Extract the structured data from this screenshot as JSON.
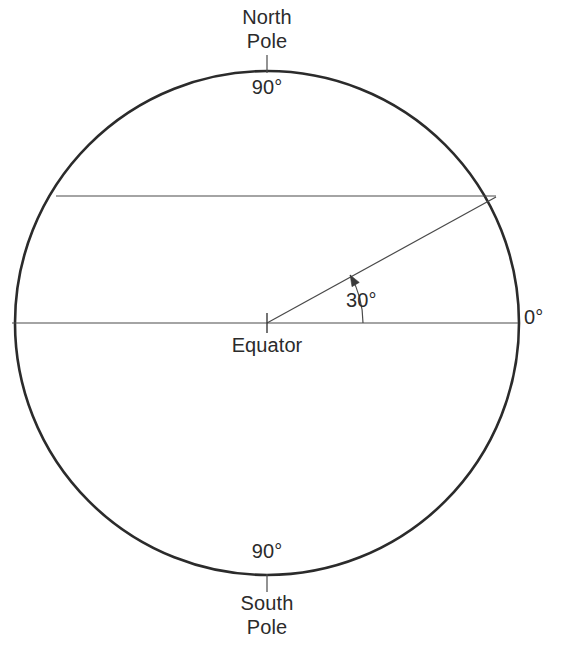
{
  "figure": {
    "background_color": "#ffffff",
    "stroke_color": "#2b2b2b",
    "text_color": "#2b2b2b"
  },
  "labels": {
    "north_pole": "North\nPole",
    "north_pole_line1": "North",
    "north_pole_line2": "Pole",
    "north_degree": "90°",
    "south_degree": "90°",
    "south_pole": "South\nPole",
    "south_pole_line1": "South",
    "south_pole_line2": "Pole",
    "equator": "Equator",
    "zero_degree": "0°",
    "angle_degree": "30°"
  },
  "chart_data": {
    "type": "diagram",
    "geometry": {
      "circle": {
        "cx": 267,
        "cy": 323,
        "r": 252,
        "stroke_width": 2.6
      },
      "equator_line": {
        "x1": 12,
        "y1": 323,
        "x2": 518,
        "y2": 323,
        "stroke_width": 1.2
      },
      "latitude_chord": {
        "x1": 56,
        "y1": 196,
        "x2": 496,
        "y2": 196,
        "stroke_width": 1.2
      },
      "radius_line": {
        "x1": 267,
        "y1": 323,
        "x2": 496,
        "y2": 197,
        "stroke_width": 1.2
      },
      "angle_arc": {
        "cx": 267,
        "cy": 323,
        "r": 96,
        "start_deg": 0,
        "end_deg": 30
      },
      "center_tick": {
        "x": 267,
        "y1": 313,
        "y2": 333
      },
      "north_pole_tick": {
        "x": 267,
        "y1": 55,
        "y2": 73
      },
      "south_pole_tick": {
        "x": 267,
        "y1": 574,
        "y2": 592
      }
    },
    "annotations": [
      {
        "name": "north-pole",
        "text": "North Pole",
        "latitude_deg": 90
      },
      {
        "name": "north-latitude",
        "text": "90°",
        "latitude_deg": 90
      },
      {
        "name": "equator",
        "text": "Equator",
        "latitude_deg": 0
      },
      {
        "name": "zero-degree",
        "text": "0°",
        "latitude_deg": 0
      },
      {
        "name": "angle",
        "text": "30°",
        "latitude_deg": 30
      },
      {
        "name": "south-latitude",
        "text": "90°",
        "latitude_deg": -90
      },
      {
        "name": "south-pole",
        "text": "South Pole",
        "latitude_deg": -90
      }
    ]
  }
}
